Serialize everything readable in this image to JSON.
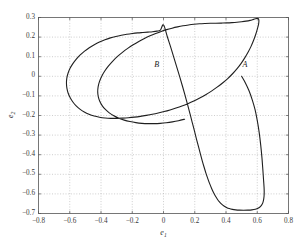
{
  "figure": {
    "background_color": "#ffffff",
    "axes_color": "#555555",
    "grid_color": "#b9b9b9",
    "curve_color": "#1f1f1f"
  },
  "chart_data": {
    "type": "line",
    "title": "",
    "subtitle": "",
    "xlabel": "e1",
    "xlabel_base": "e",
    "xlabel_sub": "1",
    "ylabel": "e2",
    "ylabel_base": "e",
    "ylabel_sub": "2",
    "xlim": [
      -0.8,
      0.8
    ],
    "ylim": [
      -0.7,
      0.3
    ],
    "xticks": [
      -0.8,
      -0.6,
      -0.4,
      -0.2,
      0,
      0.2,
      0.4,
      0.6,
      0.8
    ],
    "xticklabels": [
      "-0.8",
      "-0.6",
      "-0.4",
      "-0.2",
      "0",
      "0.2",
      "0.4",
      "0.6",
      "0.8"
    ],
    "yticks": [
      0.3,
      0.2,
      0.1,
      0,
      -0.1,
      -0.2,
      -0.3,
      -0.4,
      -0.5,
      -0.6,
      -0.7
    ],
    "yticklabels": [
      "0.3",
      "0.2",
      "0.1",
      "0",
      "-0.1",
      "-0.2",
      "-0.3",
      "-0.4",
      "-0.5",
      "-0.6",
      "-0.7"
    ],
    "grid": true,
    "grid_style": "dotted",
    "legend": null,
    "annotations": [
      {
        "text": "A",
        "x": 0.5,
        "y": 0.0,
        "label_dx": 0.025,
        "label_dy": 0.045
      },
      {
        "text": "B",
        "x": 0.0,
        "y": 0.0,
        "label_dx": -0.04,
        "label_dy": 0.045
      }
    ],
    "series": [
      {
        "name": "phase-trajectory",
        "color": "#1f1f1f",
        "linewidth": 1.1,
        "points": [
          [
            0.5,
            0.0
          ],
          [
            0.525,
            -0.035
          ],
          [
            0.548,
            -0.075
          ],
          [
            0.568,
            -0.12
          ],
          [
            0.586,
            -0.17
          ],
          [
            0.6,
            -0.225
          ],
          [
            0.612,
            -0.285
          ],
          [
            0.622,
            -0.35
          ],
          [
            0.63,
            -0.415
          ],
          [
            0.636,
            -0.478
          ],
          [
            0.6405,
            -0.53
          ],
          [
            0.6435,
            -0.565
          ],
          [
            0.6445,
            -0.59
          ],
          [
            0.6435,
            -0.612
          ],
          [
            0.6395,
            -0.634
          ],
          [
            0.632,
            -0.652
          ],
          [
            0.62,
            -0.665
          ],
          [
            0.605,
            -0.6735
          ],
          [
            0.588,
            -0.6785
          ],
          [
            0.566,
            -0.6815
          ],
          [
            0.54,
            -0.683
          ],
          [
            0.512,
            -0.6835
          ],
          [
            0.486,
            -0.683
          ],
          [
            0.462,
            -0.6815
          ],
          [
            0.441,
            -0.679
          ],
          [
            0.421,
            -0.675
          ],
          [
            0.403,
            -0.669
          ],
          [
            0.387,
            -0.6615
          ],
          [
            0.372,
            -0.652
          ],
          [
            0.358,
            -0.6405
          ],
          [
            0.345,
            -0.627
          ],
          [
            0.332,
            -0.611
          ],
          [
            0.32,
            -0.593
          ],
          [
            0.308,
            -0.572
          ],
          [
            0.296,
            -0.549
          ],
          [
            0.284,
            -0.523
          ],
          [
            0.272,
            -0.495
          ],
          [
            0.26,
            -0.464
          ],
          [
            0.248,
            -0.431
          ],
          [
            0.236,
            -0.396
          ],
          [
            0.224,
            -0.359
          ],
          [
            0.211,
            -0.32
          ],
          [
            0.198,
            -0.279
          ],
          [
            0.184,
            -0.236
          ],
          [
            0.17,
            -0.192
          ],
          [
            0.155,
            -0.147
          ],
          [
            0.139,
            -0.1
          ],
          [
            0.122,
            -0.052
          ],
          [
            0.104,
            -0.003
          ],
          [
            0.085,
            0.047
          ],
          [
            0.0655,
            0.098
          ],
          [
            0.0455,
            0.15
          ],
          [
            0.0245,
            0.202
          ],
          [
            0.0,
            0.262
          ],
          [
            -0.02,
            0.2355
          ],
          [
            -0.042,
            0.2305
          ],
          [
            -0.07,
            0.2275
          ],
          [
            -0.1,
            0.2255
          ],
          [
            -0.132,
            0.2235
          ],
          [
            -0.165,
            0.2215
          ],
          [
            -0.2,
            0.2185
          ],
          [
            -0.235,
            0.2145
          ],
          [
            -0.27,
            0.2095
          ],
          [
            -0.305,
            0.2035
          ],
          [
            -0.34,
            0.196
          ],
          [
            -0.375,
            0.1865
          ],
          [
            -0.41,
            0.175
          ],
          [
            -0.443,
            0.1615
          ],
          [
            -0.475,
            0.146
          ],
          [
            -0.505,
            0.1285
          ],
          [
            -0.533,
            0.109
          ],
          [
            -0.558,
            0.0875
          ],
          [
            -0.58,
            0.0645
          ],
          [
            -0.598,
            0.0405
          ],
          [
            -0.611,
            0.0155
          ],
          [
            -0.619,
            -0.0105
          ],
          [
            -0.621,
            -0.0365
          ],
          [
            -0.618,
            -0.062
          ],
          [
            -0.61,
            -0.0865
          ],
          [
            -0.597,
            -0.1095
          ],
          [
            -0.58,
            -0.131
          ],
          [
            -0.559,
            -0.1505
          ],
          [
            -0.535,
            -0.1675
          ],
          [
            -0.507,
            -0.182
          ],
          [
            -0.477,
            -0.1935
          ],
          [
            -0.444,
            -0.2025
          ],
          [
            -0.41,
            -0.2085
          ],
          [
            -0.374,
            -0.2125
          ],
          [
            -0.337,
            -0.2145
          ],
          [
            -0.3,
            -0.2145
          ],
          [
            -0.262,
            -0.2135
          ],
          [
            -0.224,
            -0.2115
          ],
          [
            -0.186,
            -0.2085
          ],
          [
            -0.148,
            -0.2045
          ],
          [
            -0.11,
            -0.1995
          ],
          [
            -0.072,
            -0.194
          ],
          [
            -0.034,
            -0.1875
          ],
          [
            0.004,
            -0.18
          ],
          [
            0.042,
            -0.1715
          ],
          [
            0.08,
            -0.162
          ],
          [
            0.118,
            -0.1515
          ],
          [
            0.156,
            -0.1395
          ],
          [
            0.194,
            -0.126
          ],
          [
            0.232,
            -0.111
          ],
          [
            0.27,
            -0.094
          ],
          [
            0.307,
            -0.0755
          ],
          [
            0.343,
            -0.0555
          ],
          [
            0.378,
            -0.034
          ],
          [
            0.411,
            -0.0115
          ],
          [
            0.442,
            0.013
          ],
          [
            0.471,
            0.039
          ],
          [
            0.497,
            0.066
          ],
          [
            0.52,
            0.094
          ],
          [
            0.541,
            0.1225
          ],
          [
            0.5595,
            0.1515
          ],
          [
            0.5755,
            0.181
          ],
          [
            0.589,
            0.2105
          ],
          [
            0.6,
            0.2395
          ],
          [
            0.6085,
            0.2665
          ],
          [
            0.6105,
            0.2855
          ],
          [
            0.6055,
            0.2945
          ],
          [
            0.594,
            0.2945
          ],
          [
            0.576,
            0.2905
          ],
          [
            0.554,
            0.2855
          ],
          [
            0.528,
            0.2815
          ],
          [
            0.5,
            0.2785
          ],
          [
            0.47,
            0.276
          ],
          [
            0.438,
            0.274
          ],
          [
            0.405,
            0.2725
          ],
          [
            0.37,
            0.2715
          ],
          [
            0.335,
            0.271
          ],
          [
            0.3,
            0.2705
          ],
          [
            0.265,
            0.2695
          ],
          [
            0.23,
            0.268
          ],
          [
            0.195,
            0.2655
          ],
          [
            0.16,
            0.262
          ],
          [
            0.125,
            0.2575
          ],
          [
            0.09,
            0.252
          ],
          [
            0.055,
            0.2455
          ],
          [
            0.02,
            0.238
          ],
          [
            -0.015,
            0.229
          ],
          [
            -0.05,
            0.2185
          ],
          [
            -0.086,
            0.2065
          ],
          [
            -0.122,
            0.193
          ],
          [
            -0.158,
            0.178
          ],
          [
            -0.194,
            0.161
          ],
          [
            -0.229,
            0.1425
          ],
          [
            -0.263,
            0.122
          ],
          [
            -0.296,
            0.1
          ],
          [
            -0.326,
            0.0765
          ],
          [
            -0.353,
            0.052
          ],
          [
            -0.377,
            0.026
          ],
          [
            -0.396,
            -0.0005
          ],
          [
            -0.41,
            -0.027
          ],
          [
            -0.4185,
            -0.0535
          ],
          [
            -0.421,
            -0.0795
          ],
          [
            -0.4175,
            -0.104
          ],
          [
            -0.408,
            -0.1275
          ],
          [
            -0.3925,
            -0.1495
          ],
          [
            -0.372,
            -0.169
          ],
          [
            -0.347,
            -0.1865
          ],
          [
            -0.318,
            -0.2015
          ],
          [
            -0.286,
            -0.2135
          ],
          [
            -0.2515,
            -0.2235
          ],
          [
            -0.215,
            -0.231
          ],
          [
            -0.177,
            -0.2365
          ],
          [
            -0.138,
            -0.24
          ],
          [
            -0.099,
            -0.2415
          ],
          [
            -0.06,
            -0.2415
          ],
          [
            -0.021,
            -0.24
          ],
          [
            0.018,
            -0.237
          ],
          [
            0.057,
            -0.2325
          ],
          [
            0.096,
            -0.2265
          ],
          [
            0.135,
            -0.219
          ]
        ]
      }
    ]
  }
}
